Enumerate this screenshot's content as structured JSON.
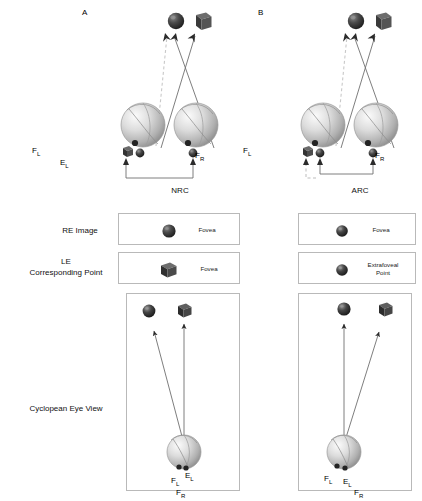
{
  "figure": {
    "panels": [
      {
        "letter": "A",
        "condition": "NRC",
        "top_objects": [
          {
            "shape": "sphere",
            "name": "target-sphere"
          },
          {
            "shape": "cube",
            "name": "target-cube"
          }
        ],
        "eye_labels": {
          "left_fovea": "F",
          "left_fovea_sub": "L",
          "left_point": "E",
          "left_point_sub": "L",
          "right_fovea": "F",
          "right_fovea_sub": "R"
        },
        "baseline_style": "solid",
        "re_image": {
          "marker": "sphere",
          "text": "Fovea"
        },
        "le_corresponding_point": {
          "marker": "cube",
          "text": "Fovea"
        },
        "cyclopean": {
          "objects": [
            {
              "shape": "sphere",
              "name": "cyclopean-sphere"
            },
            {
              "shape": "cube",
              "name": "cyclopean-cube"
            }
          ],
          "vertical_arrow_target": "cube",
          "diagonal_arrow_target": "sphere",
          "diagonal_direction": "left",
          "labels": [
            "F",
            "E",
            "F"
          ],
          "labels_sub": [
            "L",
            "L",
            "R"
          ]
        }
      },
      {
        "letter": "B",
        "condition": "ARC",
        "top_objects": [
          {
            "shape": "sphere",
            "name": "target-sphere"
          },
          {
            "shape": "cube",
            "name": "target-cube"
          }
        ],
        "eye_labels": {
          "left_fovea": "F",
          "left_fovea_sub": "L",
          "left_point": "E",
          "left_point_sub": "L",
          "right_fovea": "F",
          "right_fovea_sub": "R"
        },
        "baseline_style": "dashed-branch",
        "re_image": {
          "marker": "sphere",
          "text": "Fovea"
        },
        "le_corresponding_point": {
          "marker": "sphere",
          "text": "Extrafoveal\nPoint",
          "line1": "Extrafoveal",
          "line2": "Point"
        },
        "cyclopean": {
          "objects": [
            {
              "shape": "sphere",
              "name": "cyclopean-sphere"
            },
            {
              "shape": "cube",
              "name": "cyclopean-cube"
            }
          ],
          "vertical_arrow_target": "sphere",
          "diagonal_arrow_target": "cube",
          "diagonal_direction": "right",
          "labels": [
            "F",
            "E",
            "F"
          ],
          "labels_sub": [
            "L",
            "L",
            "R"
          ]
        }
      }
    ],
    "row_labels": {
      "re_image": "RE Image",
      "le_corresponding_point_line1": "LE",
      "le_corresponding_point_line2": "Corresponding Point",
      "cyclopean": "Cyclopean Eye View"
    },
    "colors": {
      "line": "#6b6b6b",
      "dark_marker": "#2b2b2b",
      "box_border": "#b9b9b9",
      "text": "#111111",
      "eye_light": "#f0f0f0",
      "eye_mid": "#c2c2c2",
      "eye_dark": "#8d8d8d"
    }
  }
}
